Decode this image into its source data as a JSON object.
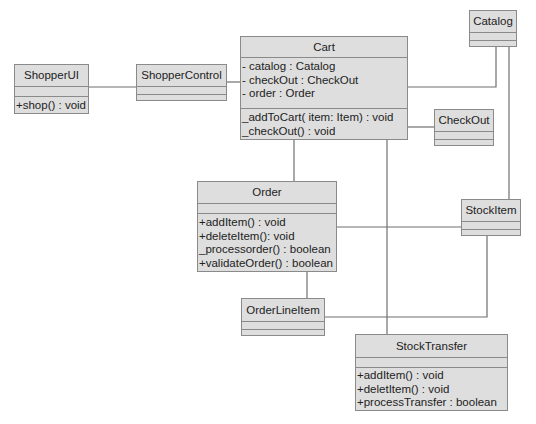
{
  "diagram": {
    "type": "UML class diagram",
    "classes": {
      "shopperui": {
        "name": "ShopperUI",
        "attributes": [],
        "methods": [
          "+shop() : void"
        ]
      },
      "shoppercontrol": {
        "name": "ShopperControl",
        "attributes": [],
        "methods": []
      },
      "cart": {
        "name": "Cart",
        "attributes": [
          "- catalog : Catalog",
          "- checkOut : CheckOut",
          "- order : Order"
        ],
        "methods": [
          "_addToCart( item: Item) : void",
          "_checkOut() : void"
        ]
      },
      "catalog": {
        "name": "Catalog",
        "attributes": [],
        "methods": []
      },
      "checkout": {
        "name": "CheckOut",
        "attributes": [],
        "methods": []
      },
      "order": {
        "name": "Order",
        "attributes": [],
        "methods": [
          "+addItem() : void",
          "+deleteItem(): void",
          "_processorder() : boolean",
          "+validateOrder() : boolean"
        ]
      },
      "stockitem": {
        "name": "StockItem",
        "attributes": [],
        "methods": []
      },
      "orderlineitem": {
        "name": "OrderLineItem",
        "attributes": [],
        "methods": []
      },
      "stocktransfer": {
        "name": "StockTransfer",
        "attributes": [],
        "methods": [
          "+addItem() : void",
          "+deletItem() : void",
          "+processTransfer : boolean"
        ]
      }
    },
    "associations": [
      {
        "from": "ShopperUI",
        "to": "ShopperControl"
      },
      {
        "from": "ShopperControl",
        "to": "Cart"
      },
      {
        "from": "Cart",
        "to": "Catalog"
      },
      {
        "from": "Cart",
        "to": "CheckOut"
      },
      {
        "from": "Cart",
        "to": "Order"
      },
      {
        "from": "Cart",
        "to": "StockTransfer"
      },
      {
        "from": "Catalog",
        "to": "StockItem"
      },
      {
        "from": "Order",
        "to": "StockItem"
      },
      {
        "from": "Order",
        "to": "OrderLineItem"
      },
      {
        "from": "OrderLineItem",
        "to": "StockItem"
      }
    ],
    "colors": {
      "box_fill": "#dedede",
      "box_border": "#8a8a8a",
      "line": "#6f6f6f",
      "text": "#222222",
      "background": "#ffffff"
    }
  }
}
